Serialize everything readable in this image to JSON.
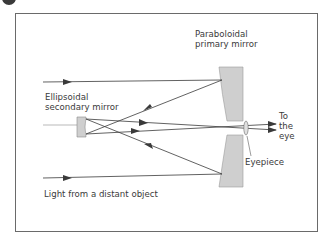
{
  "diagram": {
    "labels": {
      "primary_mirror": [
        "Paraboloidal",
        "primary mirror"
      ],
      "secondary_mirror": [
        "Ellipsoidal",
        "secondary mirror"
      ],
      "to_the_eye": [
        "To",
        "the",
        "eye"
      ],
      "eyepiece": "Eyepiece",
      "light_source": "Light from a distant object"
    },
    "colors": {
      "line": "#3a3a3a",
      "mirror_fill": "#cfcfcf",
      "mirror_stroke": "#8a8a8a",
      "frame": "#6a6a6a"
    }
  }
}
